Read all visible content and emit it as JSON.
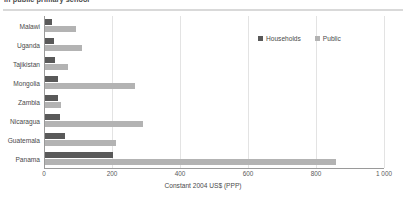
{
  "chart_data": {
    "type": "bar",
    "orientation": "horizontal",
    "title": "in public primary school",
    "xlabel": "Constant 2004 US$ (PPP)",
    "ylabel": "",
    "xlim": [
      0,
      1000
    ],
    "xticks": [
      0,
      200,
      400,
      600,
      800,
      1000
    ],
    "xtick_labels": [
      "0",
      "200",
      "400",
      "600",
      "800",
      "1 000"
    ],
    "grid": "vertical",
    "legend_position": "top-right",
    "categories": [
      "Malawi",
      "Uganda",
      "Tajikistan",
      "Mongolia",
      "Zambia",
      "Nicaragua",
      "Guatemala",
      "Panama"
    ],
    "series": [
      {
        "name": "Households",
        "color": "#595959",
        "values": [
          22,
          27,
          30,
          38,
          38,
          44,
          60,
          200
        ]
      },
      {
        "name": "Public",
        "color": "#b3b3b3",
        "values": [
          90,
          110,
          68,
          265,
          47,
          288,
          208,
          855
        ]
      }
    ]
  },
  "colors": {
    "households": "#595959",
    "public": "#b3b3b3",
    "gridline": "#e3e3e3",
    "axis": "#9a9a9a",
    "rule": "#d9d9d9",
    "text": "#4a4a4a"
  }
}
